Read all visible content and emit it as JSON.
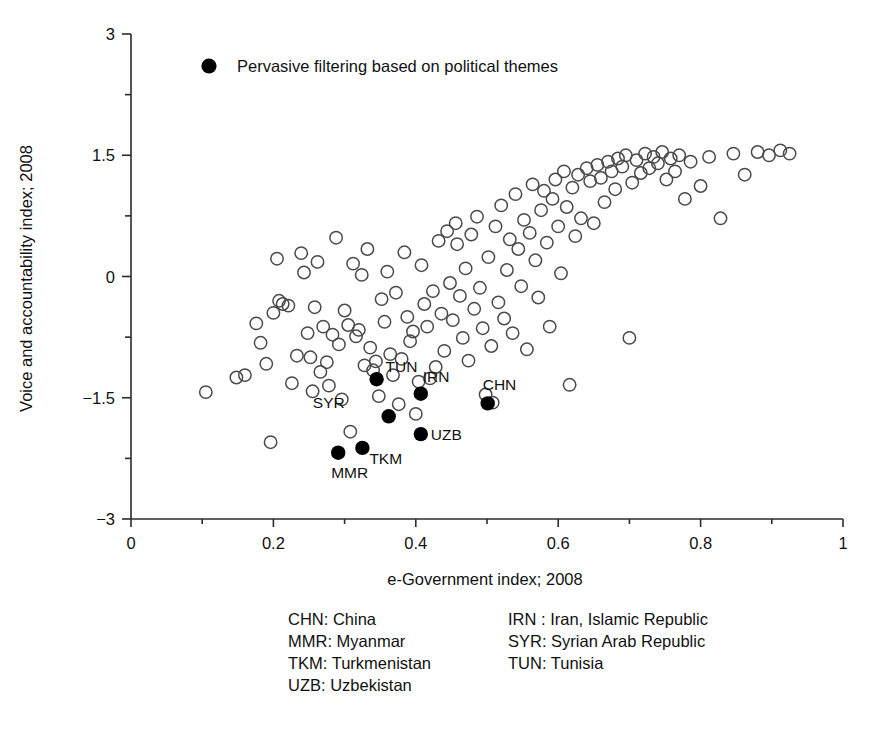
{
  "chart_data": {
    "type": "scatter",
    "title": "",
    "xlabel": "e-Government index; 2008",
    "ylabel": "Voice and accountability index; 2008",
    "xlim": [
      0,
      1
    ],
    "ylim": [
      -3,
      3
    ],
    "xticks": [
      0,
      0.2,
      0.4,
      0.6,
      0.8,
      1
    ],
    "xtick_labels": [
      "0",
      "0.2",
      "0.4",
      "0.6",
      "0.8",
      "1"
    ],
    "xminor_ticks": [
      0.1,
      0.3,
      0.5,
      0.7,
      0.9
    ],
    "yticks": [
      -3,
      -1.5,
      0,
      1.5,
      3
    ],
    "ytick_labels": [
      "−3",
      "−1.5",
      "0",
      "1.5",
      "3"
    ],
    "yminor_ticks": [
      -2.25,
      -0.75,
      0.75,
      2.25
    ],
    "grid": false,
    "legend_position": "top-left-inside",
    "series": [
      {
        "name": "Other countries",
        "marker": "open-circle",
        "color": "#4a4a4a",
        "fill": "none",
        "points": [
          [
            0.105,
            -1.43
          ],
          [
            0.148,
            -1.25
          ],
          [
            0.16,
            -1.22
          ],
          [
            0.176,
            -0.58
          ],
          [
            0.182,
            -0.82
          ],
          [
            0.19,
            -1.08
          ],
          [
            0.196,
            -2.05
          ],
          [
            0.2,
            -0.45
          ],
          [
            0.205,
            0.22
          ],
          [
            0.208,
            -0.3
          ],
          [
            0.213,
            -0.34
          ],
          [
            0.221,
            -0.36
          ],
          [
            0.226,
            -1.32
          ],
          [
            0.233,
            -0.98
          ],
          [
            0.239,
            0.29
          ],
          [
            0.243,
            0.05
          ],
          [
            0.248,
            -0.7
          ],
          [
            0.252,
            -1.0
          ],
          [
            0.255,
            -1.42
          ],
          [
            0.258,
            -0.38
          ],
          [
            0.262,
            0.18
          ],
          [
            0.266,
            -1.18
          ],
          [
            0.27,
            -0.62
          ],
          [
            0.275,
            -1.06
          ],
          [
            0.278,
            -1.35
          ],
          [
            0.283,
            -0.72
          ],
          [
            0.288,
            0.48
          ],
          [
            0.292,
            -0.84
          ],
          [
            0.296,
            -1.52
          ],
          [
            0.3,
            -0.42
          ],
          [
            0.305,
            -0.6
          ],
          [
            0.308,
            -1.92
          ],
          [
            0.312,
            0.16
          ],
          [
            0.316,
            -0.74
          ],
          [
            0.32,
            -0.66
          ],
          [
            0.324,
            0.02
          ],
          [
            0.328,
            -1.1
          ],
          [
            0.332,
            0.34
          ],
          [
            0.336,
            -0.88
          ],
          [
            0.34,
            -1.16
          ],
          [
            0.344,
            -1.05
          ],
          [
            0.348,
            -1.48
          ],
          [
            0.352,
            -0.28
          ],
          [
            0.356,
            -0.56
          ],
          [
            0.36,
            0.06
          ],
          [
            0.364,
            -0.96
          ],
          [
            0.368,
            -1.22
          ],
          [
            0.372,
            -0.2
          ],
          [
            0.376,
            -1.58
          ],
          [
            0.38,
            -1.02
          ],
          [
            0.384,
            0.3
          ],
          [
            0.388,
            -0.5
          ],
          [
            0.392,
            -0.8
          ],
          [
            0.396,
            -0.68
          ],
          [
            0.4,
            -1.7
          ],
          [
            0.404,
            -1.3
          ],
          [
            0.408,
            0.14
          ],
          [
            0.412,
            -0.34
          ],
          [
            0.416,
            -0.62
          ],
          [
            0.42,
            -1.26
          ],
          [
            0.424,
            -0.18
          ],
          [
            0.428,
            -1.12
          ],
          [
            0.432,
            0.44
          ],
          [
            0.436,
            -0.46
          ],
          [
            0.44,
            -0.92
          ],
          [
            0.444,
            0.56
          ],
          [
            0.448,
            -0.08
          ],
          [
            0.452,
            -0.54
          ],
          [
            0.456,
            0.66
          ],
          [
            0.458,
            0.4
          ],
          [
            0.462,
            -0.24
          ],
          [
            0.466,
            -0.76
          ],
          [
            0.47,
            0.1
          ],
          [
            0.474,
            -1.04
          ],
          [
            0.478,
            0.52
          ],
          [
            0.482,
            -0.4
          ],
          [
            0.486,
            0.74
          ],
          [
            0.49,
            -0.14
          ],
          [
            0.494,
            -0.64
          ],
          [
            0.498,
            -1.46
          ],
          [
            0.502,
            0.24
          ],
          [
            0.506,
            -0.86
          ],
          [
            0.508,
            -1.56
          ],
          [
            0.512,
            0.62
          ],
          [
            0.516,
            -0.32
          ],
          [
            0.52,
            0.88
          ],
          [
            0.524,
            -0.52
          ],
          [
            0.528,
            0.08
          ],
          [
            0.532,
            0.46
          ],
          [
            0.536,
            -0.7
          ],
          [
            0.54,
            1.02
          ],
          [
            0.544,
            0.34
          ],
          [
            0.548,
            -0.12
          ],
          [
            0.552,
            0.7
          ],
          [
            0.556,
            -0.9
          ],
          [
            0.56,
            0.54
          ],
          [
            0.564,
            1.14
          ],
          [
            0.568,
            0.2
          ],
          [
            0.572,
            -0.26
          ],
          [
            0.576,
            0.82
          ],
          [
            0.58,
            1.06
          ],
          [
            0.584,
            0.42
          ],
          [
            0.588,
            -0.62
          ],
          [
            0.592,
            0.96
          ],
          [
            0.596,
            1.2
          ],
          [
            0.6,
            0.62
          ],
          [
            0.604,
            0.04
          ],
          [
            0.608,
            1.3
          ],
          [
            0.612,
            0.86
          ],
          [
            0.616,
            -1.34
          ],
          [
            0.62,
            1.1
          ],
          [
            0.624,
            0.5
          ],
          [
            0.628,
            1.26
          ],
          [
            0.632,
            0.72
          ],
          [
            0.64,
            1.34
          ],
          [
            0.645,
            1.18
          ],
          [
            0.65,
            0.66
          ],
          [
            0.655,
            1.38
          ],
          [
            0.66,
            1.22
          ],
          [
            0.665,
            0.92
          ],
          [
            0.67,
            1.42
          ],
          [
            0.675,
            1.3
          ],
          [
            0.68,
            1.08
          ],
          [
            0.684,
            1.46
          ],
          [
            0.69,
            1.36
          ],
          [
            0.695,
            1.5
          ],
          [
            0.7,
            -0.76
          ],
          [
            0.704,
            1.16
          ],
          [
            0.71,
            1.44
          ],
          [
            0.716,
            1.28
          ],
          [
            0.722,
            1.52
          ],
          [
            0.728,
            1.34
          ],
          [
            0.734,
            1.48
          ],
          [
            0.74,
            1.4
          ],
          [
            0.746,
            1.54
          ],
          [
            0.752,
            1.2
          ],
          [
            0.758,
            1.46
          ],
          [
            0.764,
            1.3
          ],
          [
            0.77,
            1.5
          ],
          [
            0.778,
            0.96
          ],
          [
            0.786,
            1.42
          ],
          [
            0.8,
            1.12
          ],
          [
            0.812,
            1.48
          ],
          [
            0.828,
            0.72
          ],
          [
            0.846,
            1.52
          ],
          [
            0.862,
            1.26
          ],
          [
            0.88,
            1.54
          ],
          [
            0.896,
            1.5
          ],
          [
            0.912,
            1.56
          ],
          [
            0.925,
            1.52
          ]
        ]
      },
      {
        "name": "Pervasive filtering based on political themes",
        "marker": "filled-circle",
        "color": "#000000",
        "fill": "#000000",
        "points": [
          {
            "code": "TUN",
            "x": 0.345,
            "y": -1.27,
            "label_dx": 9,
            "label_dy": -7
          },
          {
            "code": "IRN",
            "x": 0.407,
            "y": -1.45,
            "label_dx": 2,
            "label_dy": -12
          },
          {
            "code": "CHN",
            "x": 0.501,
            "y": -1.57,
            "label_dx": -5,
            "label_dy": -13
          },
          {
            "code": "SYR",
            "x": 0.362,
            "y": -1.73,
            "label_dx": -44,
            "label_dy": -8
          },
          {
            "code": "UZB",
            "x": 0.407,
            "y": -1.95,
            "label_dx": 10,
            "label_dy": 6
          },
          {
            "code": "TKM",
            "x": 0.325,
            "y": -2.12,
            "label_dx": 7,
            "label_dy": 16
          },
          {
            "code": "MMR",
            "x": 0.291,
            "y": -2.18,
            "label_dx": -7,
            "label_dy": 25
          }
        ]
      }
    ]
  },
  "legend": {
    "marker_name": "filled-circle-marker",
    "label": "Pervasive filtering based on political themes"
  },
  "caption": {
    "columns": [
      {
        "lines": [
          "CHN: China",
          "MMR: Myanmar",
          "TKM: Turkmenistan",
          "UZB: Uzbekistan"
        ]
      },
      {
        "lines": [
          "IRN : Iran, Islamic Republic",
          "SYR: Syrian Arab Republic",
          "TUN: Tunisia"
        ]
      }
    ]
  }
}
